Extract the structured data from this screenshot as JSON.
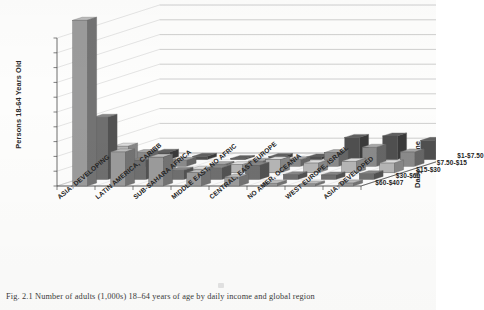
{
  "figure": {
    "caption": "Fig. 2.1  Number of adults (1,000s) 18–64 years of age by daily income and global region"
  },
  "axes": {
    "y_title": "Persons 18-64 Years Old",
    "z_title": "Daily Income",
    "y_ticks": [
      "1,000,000",
      "900,000",
      "800,000",
      "700,000",
      "600,000",
      "500,000",
      "400,000",
      "300,000",
      "200,000",
      "100,000",
      "0"
    ]
  },
  "chart_data": {
    "type": "bar",
    "subtype": "3d-grouped-bar",
    "title": "Number of adults (1,000s) 18–64 years of age by daily income and global region",
    "xlabel": "",
    "ylabel": "Persons 18-64 Years Old",
    "zlabel": "Daily Income",
    "ylim": [
      0,
      1000000
    ],
    "ytick_step": 100000,
    "grid": true,
    "legend_position": "right-depth-axis",
    "categories": [
      "ASIA: DEVELOPING",
      "LATIN AMERICA, CARIBB",
      "SUB-SAHARA AFRICA",
      "MIDDLE EAST, NO AFRIC",
      "CENTRAL, EAST EUROPE",
      "NO AMER, OCEANIA",
      "WEST EUROPE, ISRAEL",
      "ASIA: DEVELOPED"
    ],
    "depth_categories": [
      "$1-$7.50",
      "$7.50-$15",
      "$15-$30",
      "$30-$60",
      "$60-$407"
    ],
    "series": [
      {
        "name": "$1-$7.50",
        "color": "#9b9b9b",
        "values": [
          1120000,
          230000,
          195000,
          90000,
          60000,
          18000,
          14000,
          20000
        ]
      },
      {
        "name": "$7.50-$15",
        "color": "#6f6f6f",
        "values": [
          420000,
          130000,
          62000,
          78000,
          95000,
          32000,
          30000,
          38000
        ]
      },
      {
        "name": "$15-$30",
        "color": "#b5b5b5",
        "values": [
          180000,
          75000,
          24000,
          55000,
          88000,
          66000,
          78000,
          66000
        ]
      },
      {
        "name": "$30-$60",
        "color": "#8a8a8a",
        "values": [
          92000,
          40000,
          12000,
          34000,
          44000,
          92000,
          128000,
          96000
        ]
      },
      {
        "name": "$60-$407",
        "color": "#4f4f4f",
        "values": [
          50000,
          22000,
          8000,
          20000,
          18000,
          150000,
          160000,
          130000
        ]
      }
    ]
  }
}
